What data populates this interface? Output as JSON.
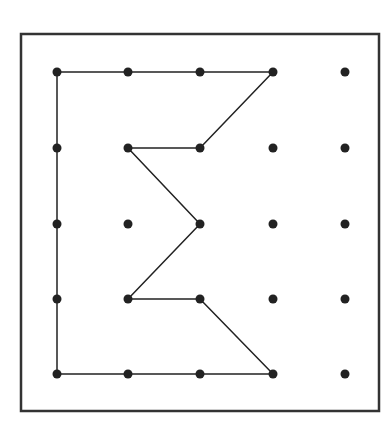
{
  "diagram": {
    "title": "",
    "type": "geoboard dot grid with sigma-shaped polygon",
    "colors": {
      "background": "#ffffff",
      "ink": "#222222",
      "frame": "#333333"
    },
    "frame": {
      "x": 21,
      "y": 34,
      "width": 358,
      "height": 377,
      "stroke_width": 2.5
    },
    "grid": {
      "columns_x": [
        57,
        128,
        200,
        273,
        345
      ],
      "rows_y": [
        72,
        148,
        224,
        299,
        374
      ],
      "dot_radius": 4.5
    },
    "path": {
      "closed": true,
      "stroke_width": 1.5,
      "points_grid": [
        [
          0,
          0
        ],
        [
          1,
          0
        ],
        [
          2,
          0
        ],
        [
          3,
          0
        ],
        [
          2,
          1
        ],
        [
          1,
          1
        ],
        [
          2,
          2
        ],
        [
          1,
          3
        ],
        [
          2,
          3
        ],
        [
          3,
          4
        ],
        [
          2,
          4
        ],
        [
          1,
          4
        ],
        [
          0,
          4
        ],
        [
          0,
          3
        ],
        [
          0,
          2
        ],
        [
          0,
          1
        ]
      ]
    }
  }
}
